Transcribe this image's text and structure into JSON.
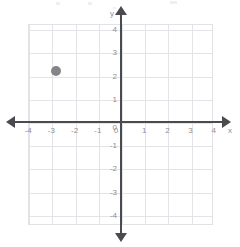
{
  "figure": {
    "background_color": "#ffffff",
    "width": 240,
    "height": 247
  },
  "chart_data": {
    "type": "scatter",
    "title": "",
    "subtitle": "",
    "xlabel": "x",
    "ylabel": "y",
    "xlim": [
      -4,
      4
    ],
    "ylim": [
      -4,
      4
    ],
    "grid": true,
    "grid_spacing": 1,
    "legend": null,
    "legend_position": "none",
    "x_tick_labels": [
      "-4",
      "-3",
      "-2",
      "-1",
      "0",
      "1",
      "2",
      "3",
      "4"
    ],
    "y_tick_labels": [
      "4",
      "3",
      "2",
      "1",
      "0",
      "-1",
      "-2",
      "-3",
      "-4"
    ],
    "x_ticks": [
      -4,
      -3,
      -2,
      -1,
      0,
      1,
      2,
      3,
      4
    ],
    "y_ticks": [
      4,
      3,
      2,
      1,
      0,
      -1,
      -2,
      -3,
      -4
    ],
    "series": [
      {
        "name": "plotted-point",
        "marker": "circle",
        "color": "#858589",
        "points": [
          {
            "x": -2.8,
            "y": 2.2,
            "label": ""
          }
        ]
      }
    ],
    "annotations": []
  },
  "axes": {
    "x_axis_name": "x",
    "y_axis_name": "y",
    "axis_color": "#4a4a4f",
    "grid_color": "#e4e4e8",
    "tick_label_color": "#8e8e94"
  },
  "artifacts": {
    "description": "faint scan marks along the top edge",
    "color": "#e9e9ec",
    "marks": [
      {
        "x": 56,
        "y": 2,
        "w": 4,
        "h": 3
      },
      {
        "x": 88,
        "y": 2,
        "w": 4,
        "h": 3
      },
      {
        "x": 170,
        "y": 1,
        "w": 7,
        "h": 3
      },
      {
        "x": 113,
        "y": 7,
        "w": 3,
        "h": 2
      }
    ]
  }
}
